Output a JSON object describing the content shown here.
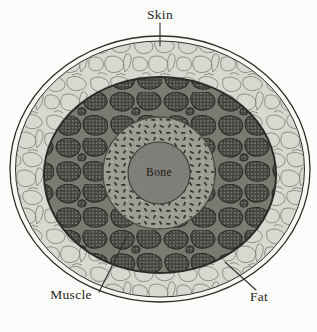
{
  "labels": {
    "skin": "Skin",
    "muscle": "Muscle",
    "fat": "Fat",
    "bone": "Bone"
  },
  "colors": {
    "background": "#fcfcfa",
    "line": "#2e2d29",
    "skin_band": "#f7f7f3",
    "fat_fill": "#d8d7d0",
    "fat_line": "#87867b",
    "muscle_septa": "#7b7a71",
    "muscle_bundle": "#454440",
    "muscle_dot": "#a7a59b",
    "muscle_outline": "#2b2a26",
    "cortex_fill": "#9e9d93",
    "cortex_mark": "#34332d",
    "cortex_fleck": "#c7c6bc",
    "bone_fill": "#81807a",
    "bone_stipple": "#63625c",
    "bone_edge": "#3e3d37",
    "label_color": "#262521"
  }
}
